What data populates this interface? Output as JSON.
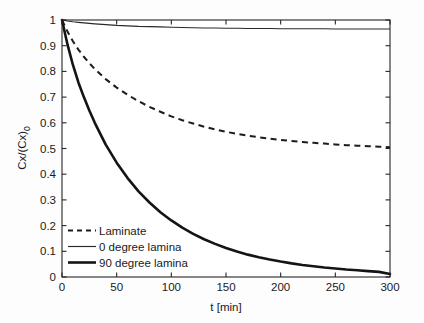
{
  "chart_data": {
    "type": "line",
    "title": "",
    "xlabel": "t [min]",
    "ylabel": "Cx/(Cx)0",
    "ylabel_base": "Cx/(Cx)",
    "ylabel_sub": "0",
    "xlim": [
      0,
      300
    ],
    "ylim": [
      0,
      1
    ],
    "grid": false,
    "legend_position": "lower-left",
    "xticks": [
      0,
      50,
      100,
      150,
      200,
      250,
      300
    ],
    "xtick_labels": [
      "0",
      "50",
      "100",
      "150",
      "200",
      "250",
      "300"
    ],
    "yticks": [
      0,
      0.1,
      0.2,
      0.3,
      0.4,
      0.5,
      0.6,
      0.7,
      0.8,
      0.9,
      1
    ],
    "ytick_labels": [
      "0",
      "0.1",
      "0.2",
      "0.3",
      "0.4",
      "0.5",
      "0.6",
      "0.7",
      "0.8",
      "0.9",
      "1"
    ],
    "x": [
      0,
      5,
      10,
      15,
      20,
      25,
      30,
      40,
      50,
      60,
      70,
      80,
      90,
      100,
      110,
      120,
      130,
      140,
      150,
      160,
      170,
      180,
      190,
      200,
      210,
      220,
      230,
      240,
      250,
      260,
      270,
      280,
      290,
      300
    ],
    "series": [
      {
        "name": "Laminate",
        "style": "dashed",
        "color": "#1c1c1c",
        "values": [
          1.0,
          0.955,
          0.917,
          0.885,
          0.857,
          0.832,
          0.809,
          0.77,
          0.737,
          0.709,
          0.684,
          0.662,
          0.643,
          0.625,
          0.61,
          0.597,
          0.585,
          0.574,
          0.565,
          0.557,
          0.55,
          0.544,
          0.538,
          0.533,
          0.529,
          0.525,
          0.522,
          0.519,
          0.516,
          0.513,
          0.511,
          0.509,
          0.507,
          0.505
        ]
      },
      {
        "name": "0 degree lamina",
        "style": "solid-thin",
        "color": "#2a2a2a",
        "values": [
          1.0,
          0.996,
          0.993,
          0.991,
          0.989,
          0.987,
          0.985,
          0.982,
          0.979,
          0.977,
          0.975,
          0.974,
          0.973,
          0.972,
          0.971,
          0.97,
          0.969,
          0.969,
          0.968,
          0.968,
          0.967,
          0.967,
          0.967,
          0.966,
          0.966,
          0.966,
          0.966,
          0.966,
          0.965,
          0.965,
          0.965,
          0.965,
          0.965,
          0.965
        ]
      },
      {
        "name": "90 degree lamina",
        "style": "solid-thick",
        "color": "#141414",
        "values": [
          1.0,
          0.905,
          0.825,
          0.757,
          0.7,
          0.648,
          0.6,
          0.515,
          0.445,
          0.385,
          0.333,
          0.29,
          0.252,
          0.22,
          0.192,
          0.168,
          0.147,
          0.129,
          0.113,
          0.099,
          0.087,
          0.077,
          0.068,
          0.06,
          0.053,
          0.047,
          0.042,
          0.037,
          0.033,
          0.029,
          0.026,
          0.023,
          0.02,
          0.012
        ]
      }
    ]
  },
  "legend": {
    "items": [
      {
        "label": "Laminate"
      },
      {
        "label": "0 degree lamina"
      },
      {
        "label": "90 degree lamina"
      }
    ]
  }
}
